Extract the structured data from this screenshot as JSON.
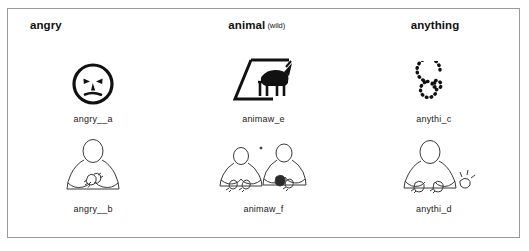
{
  "figure": {
    "border_color": "#9a9a9a",
    "background": "#ffffff",
    "ink_color": "#111111"
  },
  "columns": [
    {
      "headword": "angry",
      "qualifier": "",
      "entries": [
        {
          "caption": "angry__a",
          "art": "angry-face-pictograph"
        },
        {
          "caption": "angry__b",
          "art": "sign-language-angry-illustration"
        }
      ]
    },
    {
      "headword": "animal",
      "qualifier": "(wild)",
      "entries": [
        {
          "caption": "animaw_e",
          "art": "wild-animal-pictograph"
        },
        {
          "caption": "animaw_f",
          "art": "sign-language-animal-illustration"
        }
      ]
    },
    {
      "headword": "anything",
      "qualifier": "",
      "entries": [
        {
          "caption": "anythi_c",
          "art": "dotted-spiral-pictograph"
        },
        {
          "caption": "anythi_d",
          "art": "sign-language-anything-illustration"
        }
      ]
    }
  ]
}
